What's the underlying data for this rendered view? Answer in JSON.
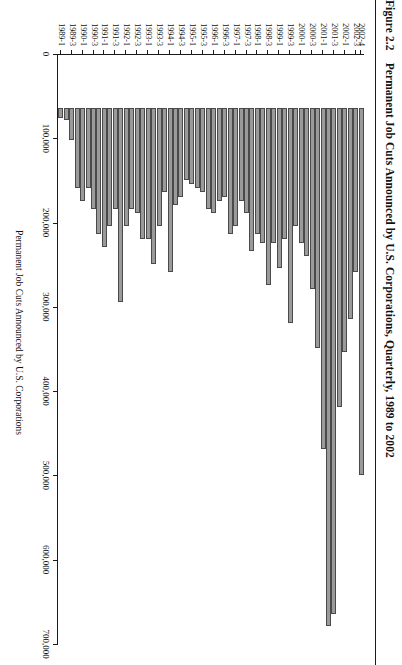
{
  "caption": {
    "figure_number": "Figure 2.2",
    "title": "Permanent Job Cuts Announced by U.S. Corporations, Quarterly, 1989 to 2002"
  },
  "axes": {
    "value_axis_title": "Permanent Job Cuts Announced by U.S. Corporations",
    "value_ticks": [
      "0",
      "100,000",
      "200,000",
      "300,000",
      "400,000",
      "500,000",
      "600,000",
      "700,000"
    ],
    "category_axis_title": ""
  },
  "chart_data": {
    "type": "bar",
    "orientation": "horizontal",
    "title": "Permanent Job Cuts Announced by U.S. Corporations, Quarterly, 1989 to 2002",
    "xlabel": "Permanent Job Cuts Announced by U.S. Corporations",
    "ylabel": "",
    "xlim": [
      0,
      700000
    ],
    "xtick_step": 100000,
    "grid": false,
    "legend": false,
    "bar_color": "#9a9a9a",
    "bar_edge_color": "#4a4a4a",
    "categories": [
      "1989-1",
      "1989-2",
      "1989-3",
      "1989-4",
      "1990-1",
      "1990-2",
      "1990-3",
      "1990-4",
      "1991-1",
      "1991-2",
      "1991-3",
      "1991-4",
      "1992-1",
      "1992-2",
      "1992-3",
      "1992-4",
      "1993-1",
      "1993-2",
      "1993-3",
      "1993-4",
      "1994-1",
      "1994-2",
      "1994-3",
      "1994-4",
      "1995-1",
      "1995-2",
      "1995-3",
      "1995-4",
      "1996-1",
      "1996-2",
      "1996-3",
      "1996-4",
      "1997-1",
      "1997-2",
      "1997-3",
      "1997-4",
      "1998-1",
      "1998-2",
      "1998-3",
      "1998-4",
      "1999-1",
      "1999-2",
      "1999-3",
      "1999-4",
      "2000-1",
      "2000-2",
      "2000-3",
      "2000-4",
      "2001-1",
      "2001-2",
      "2001-3",
      "2001-4",
      "2002-1",
      "2002-2",
      "2002-3",
      "2002-4"
    ],
    "labeled_categories": [
      "1989-1",
      "1989-3",
      "1990-1",
      "1990-3",
      "1991-1",
      "1991-3",
      "1992-1",
      "1992-3",
      "1993-1",
      "1993-3",
      "1994-1",
      "1994-3",
      "1995-1",
      "1995-3",
      "1996-1",
      "1996-3",
      "1997-1",
      "1997-3",
      "1998-1",
      "1998-3",
      "1999-1",
      "1999-3",
      "2000-1",
      "2000-3",
      "2001-1",
      "2001-3",
      "2002-1",
      "2002-3",
      "2002-4"
    ],
    "values": [
      12000,
      14000,
      38000,
      95000,
      110000,
      95000,
      120000,
      150000,
      165000,
      140000,
      120000,
      230000,
      140000,
      120000,
      125000,
      155000,
      155000,
      185000,
      140000,
      100000,
      195000,
      115000,
      105000,
      85000,
      90000,
      95000,
      100000,
      120000,
      125000,
      110000,
      105000,
      150000,
      140000,
      110000,
      125000,
      170000,
      150000,
      160000,
      210000,
      160000,
      190000,
      155000,
      255000,
      140000,
      160000,
      175000,
      215000,
      285000,
      405000,
      615000,
      600000,
      355000,
      290000,
      250000,
      195000,
      435000
    ]
  }
}
